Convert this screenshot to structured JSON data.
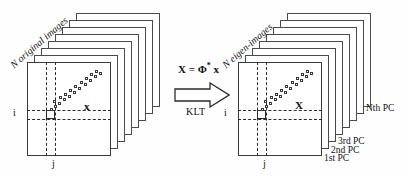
{
  "figure": {
    "type": "diagram"
  },
  "left_stack": {
    "caption": "N original images",
    "sheet_count": 7,
    "vector_symbol": "x",
    "row_label": "i",
    "column_label": "j"
  },
  "right_stack": {
    "caption": "N eigen-images",
    "sheet_count": 7,
    "vector_symbol": "X",
    "row_label": "i",
    "column_label": "j",
    "pc_labels": [
      {
        "text": "1st PC"
      },
      {
        "text": "2nd PC"
      },
      {
        "text": "3rd PC"
      },
      {
        "text": "Nth PC"
      }
    ]
  },
  "transform": {
    "equation_lhs": "X",
    "equation_eq": "=",
    "equation_phi": "Φ",
    "equation_sup": "*",
    "equation_rhs": "x",
    "arrow_label": "KLT",
    "arrow_direction": "right"
  },
  "colors": {
    "stroke": "#3a3a3a",
    "dash": "#2b2b2b",
    "background": "#ffffff",
    "text": "#111111"
  }
}
